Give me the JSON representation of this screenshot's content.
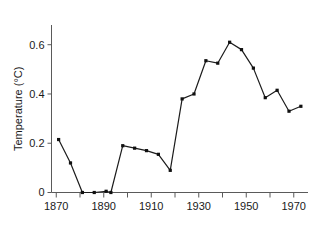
{
  "chart_data": {
    "type": "line",
    "title": "",
    "subtitle": "",
    "xlabel": "",
    "ylabel": "Temperature (°C)",
    "xlim": [
      1868,
      1976
    ],
    "ylim": [
      0,
      0.68
    ],
    "grid": false,
    "legend": null,
    "x_ticks_major": [
      1870,
      1890,
      1910,
      1930,
      1950,
      1970
    ],
    "x_tick_labels": [
      "1870",
      "1890",
      "1910",
      "1930",
      "1950",
      "1970"
    ],
    "x_ticks_minor": [
      1880,
      1900,
      1920,
      1940,
      1960
    ],
    "y_ticks": [
      0,
      0.2,
      0.4,
      0.6
    ],
    "y_tick_labels": [
      "0",
      "0.2",
      "0.4",
      "0.6"
    ],
    "x": [
      1871,
      1876,
      1881,
      1886,
      1891,
      1893,
      1898,
      1903,
      1908,
      1913,
      1918,
      1923,
      1928,
      1933,
      1938,
      1943,
      1948,
      1953,
      1958,
      1963,
      1968,
      1973
    ],
    "values": [
      0.215,
      0.12,
      0.0,
      0.0,
      0.005,
      0.0,
      0.19,
      0.18,
      0.17,
      0.155,
      0.09,
      0.38,
      0.4,
      0.535,
      0.525,
      0.61,
      0.58,
      0.505,
      0.385,
      0.415,
      0.33,
      0.35
    ],
    "series": [
      {
        "name": "Temperature",
        "x": [
          1871,
          1876,
          1881,
          1886,
          1891,
          1893,
          1898,
          1903,
          1908,
          1913,
          1918,
          1923,
          1928,
          1933,
          1938,
          1943,
          1948,
          1953,
          1958,
          1963,
          1968,
          1973
        ],
        "values": [
          0.215,
          0.12,
          0.0,
          0.0,
          0.005,
          0.0,
          0.19,
          0.18,
          0.17,
          0.155,
          0.09,
          0.38,
          0.4,
          0.535,
          0.525,
          0.61,
          0.58,
          0.505,
          0.385,
          0.415,
          0.33,
          0.35
        ],
        "color": "#1c1c1c",
        "marker": "square"
      }
    ]
  },
  "style": {
    "axis_color": "#5a5a5a",
    "text_color": "#1a1a1a",
    "line_color": "#1c1c1c",
    "background": "#ffffff"
  }
}
